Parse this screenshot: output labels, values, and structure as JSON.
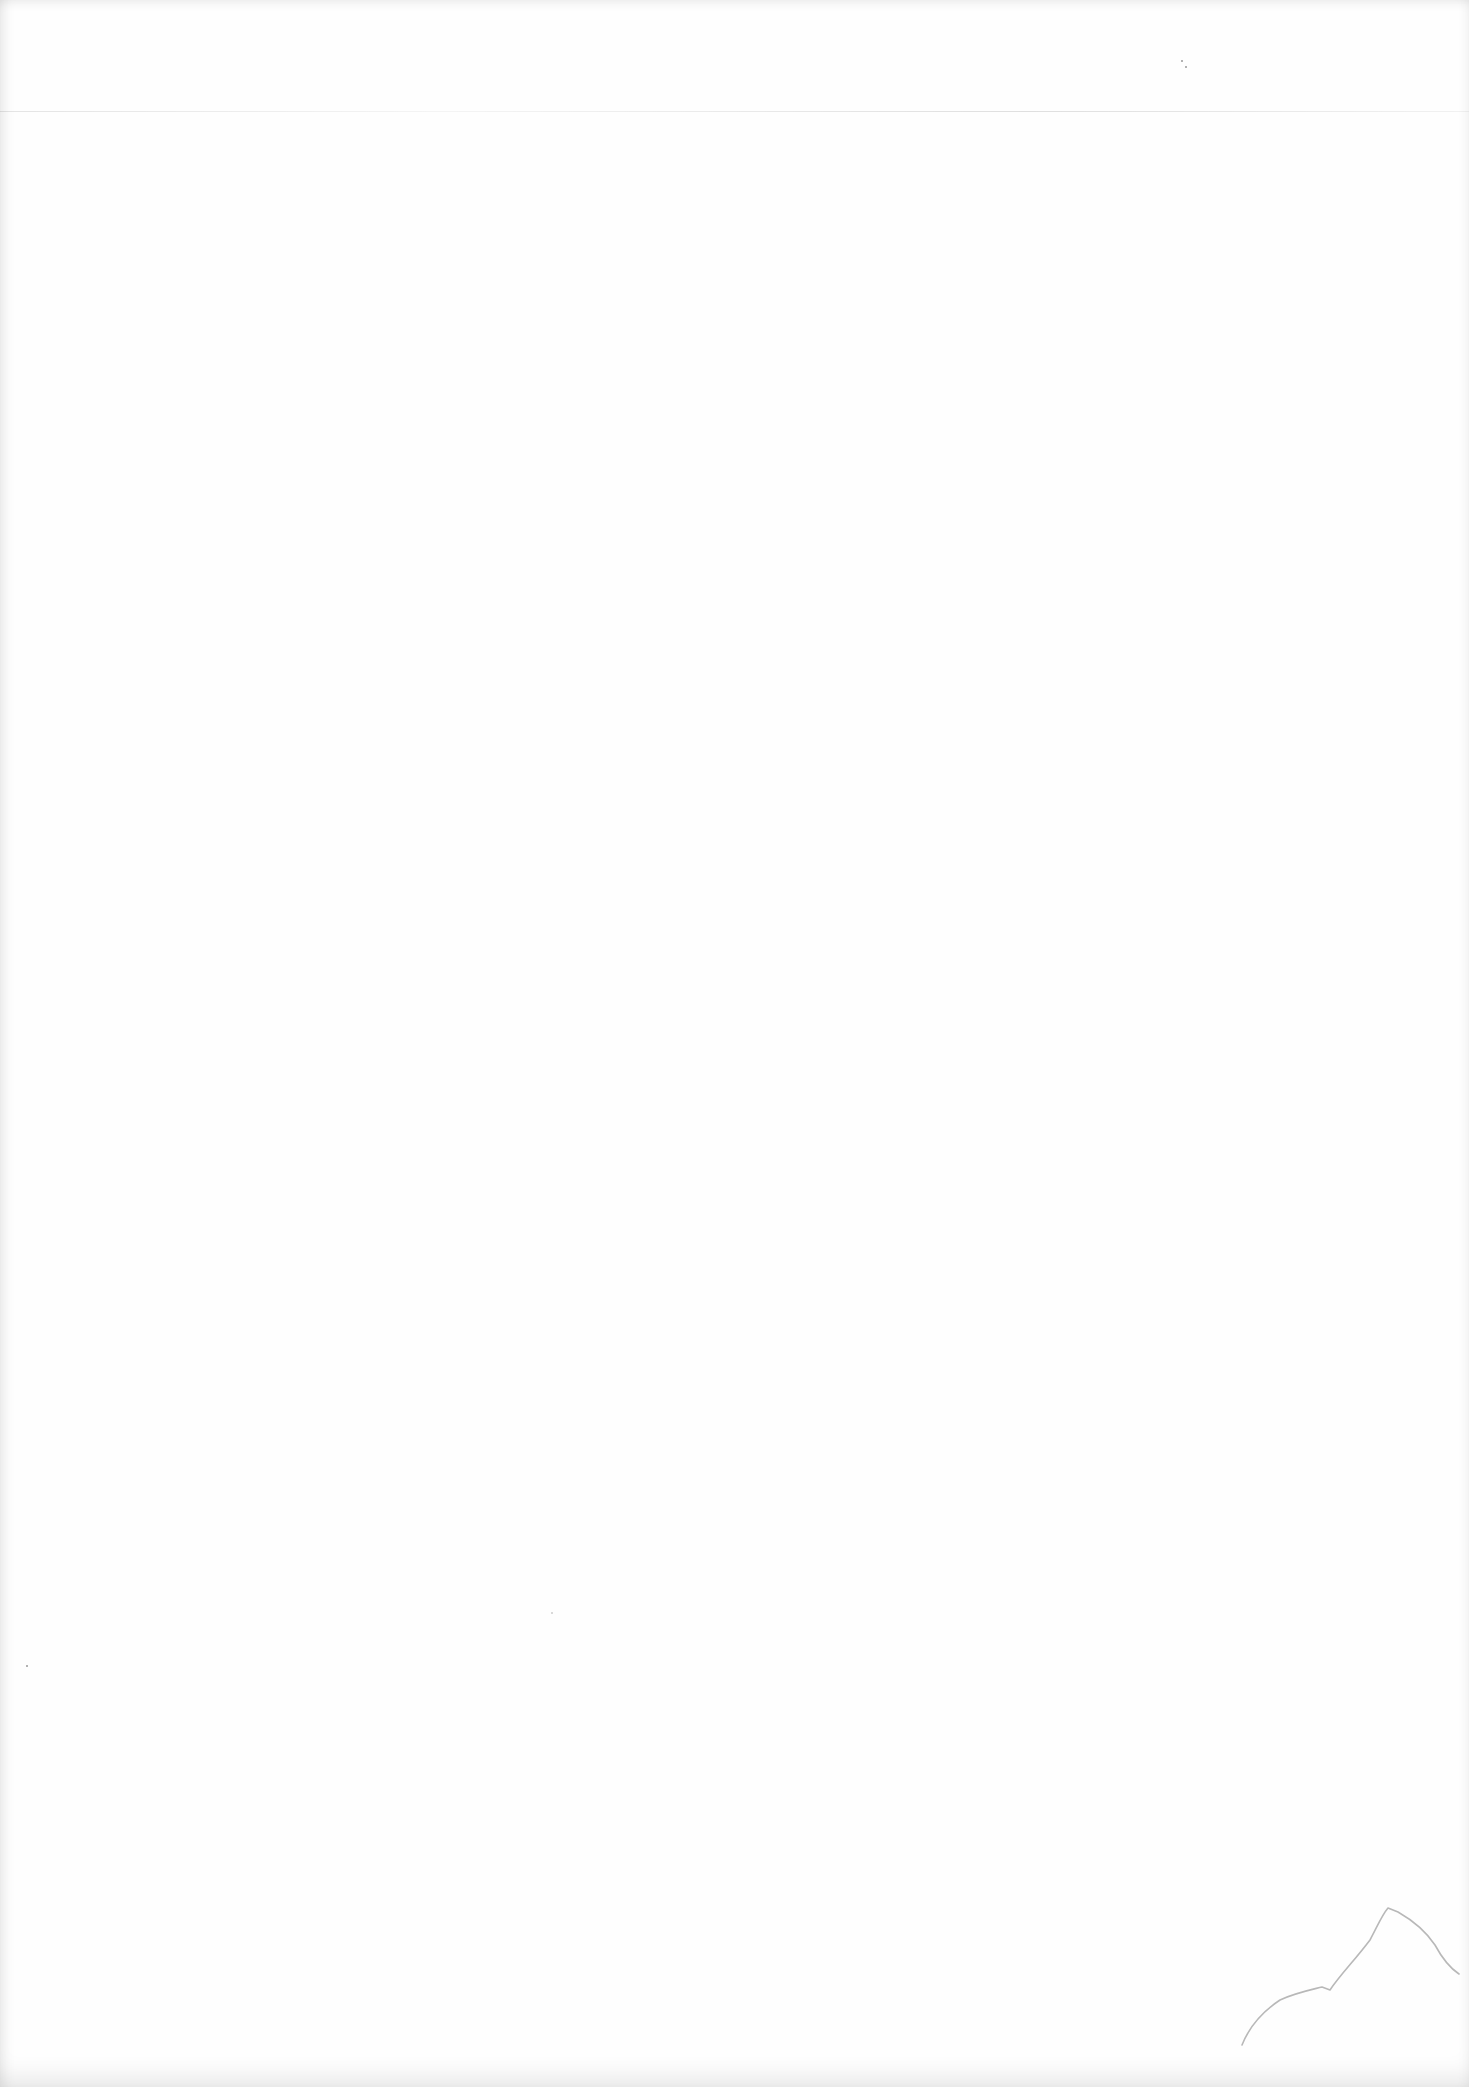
{
  "document": {
    "type": "blank scanned page",
    "text_content": "",
    "background_color": "#fefefe",
    "marks": [
      {
        "name": "horizontal-scan-line",
        "y": 111
      },
      {
        "name": "speck",
        "x": 1181,
        "y": 60
      },
      {
        "name": "speck",
        "x": 1185,
        "y": 65
      },
      {
        "name": "speck",
        "x": 26,
        "y": 1665
      },
      {
        "name": "speck",
        "x": 551,
        "y": 1612
      },
      {
        "name": "torn-corner-crease",
        "region": "bottom-right"
      }
    ]
  }
}
